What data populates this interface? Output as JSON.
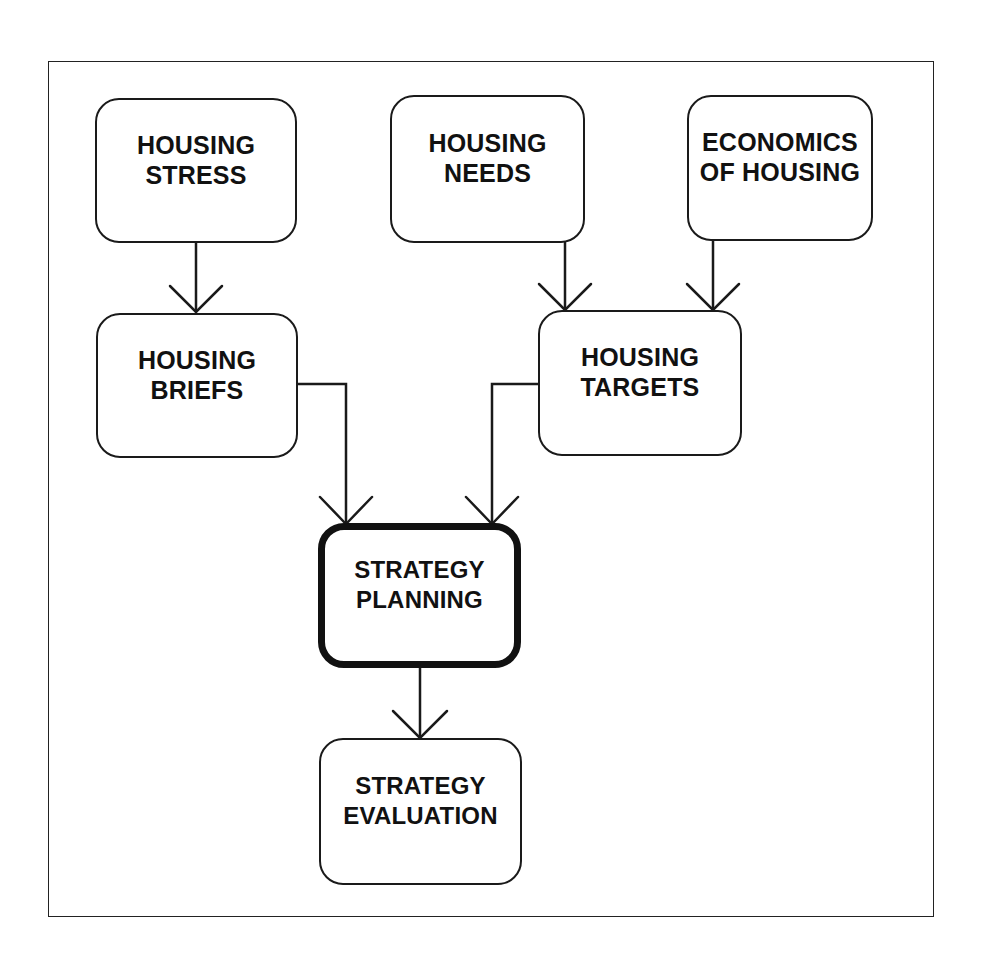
{
  "diagram": {
    "nodes": [
      {
        "id": "housing-stress",
        "lines": [
          "HOUSING",
          "STRESS"
        ]
      },
      {
        "id": "housing-needs",
        "lines": [
          "HOUSING",
          "NEEDS"
        ]
      },
      {
        "id": "economics-of-housing",
        "lines": [
          "ECONOMICS",
          "OF HOUSING"
        ]
      },
      {
        "id": "housing-briefs",
        "lines": [
          "HOUSING",
          "BRIEFS"
        ]
      },
      {
        "id": "housing-targets",
        "lines": [
          "HOUSING",
          "TARGETS"
        ]
      },
      {
        "id": "strategy-planning",
        "lines": [
          "STRATEGY",
          "PLANNING"
        ],
        "emphasized": true
      },
      {
        "id": "strategy-evaluation",
        "lines": [
          "STRATEGY",
          "EVALUATION"
        ]
      }
    ],
    "edges": [
      {
        "from": "housing-stress",
        "to": "housing-briefs"
      },
      {
        "from": "housing-needs",
        "to": "housing-targets"
      },
      {
        "from": "economics-of-housing",
        "to": "housing-targets"
      },
      {
        "from": "housing-briefs",
        "to": "strategy-planning"
      },
      {
        "from": "housing-targets",
        "to": "strategy-planning"
      },
      {
        "from": "strategy-planning",
        "to": "strategy-evaluation"
      }
    ],
    "colors": {
      "line": "#1a1a1a",
      "background": "#ffffff"
    }
  }
}
